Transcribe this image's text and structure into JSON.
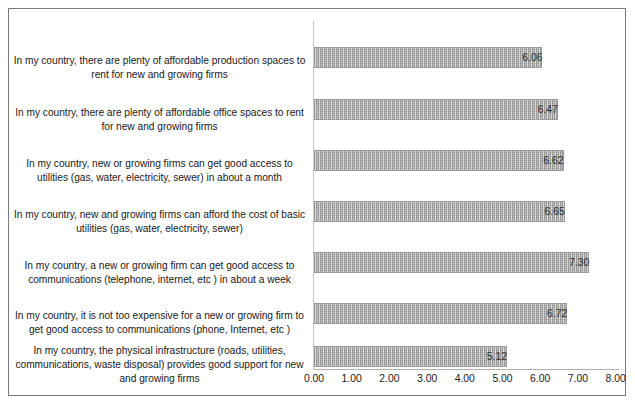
{
  "chart_data": {
    "type": "bar",
    "orientation": "horizontal",
    "title": "",
    "xlabel": "",
    "ylabel": "",
    "xlim": [
      0.0,
      8.0
    ],
    "xticks": [
      "0.00",
      "1.00",
      "2.00",
      "3.00",
      "4.00",
      "5.00",
      "6.00",
      "7.00",
      "8.00"
    ],
    "grid": false,
    "legend": "none",
    "categories": [
      "In my country, there are plenty of affordable production spaces to rent for new and growing firms",
      "In my country, there are plenty of affordable office spaces to rent for new and growing firms",
      "In my country, new or growing firms can get good access to utilities (gas, water, electricity, sewer) in about a month",
      "In my country, new and growing firms can afford the cost of basic utilities (gas, water, electricity, sewer)",
      "In my country, a new or growing firm can get good access to communications (telephone, internet, etc ) in about a week",
      "In my country, it is not too expensive for a new or growing firm to get good access to communications (phone, Internet, etc )",
      "In my country, the physical infrastructure (roads, utilities, communications, waste disposal) provides good support for new and growing firms"
    ],
    "values": [
      6.06,
      6.47,
      6.62,
      6.65,
      7.3,
      6.72,
      5.12
    ],
    "value_labels": [
      "6.06",
      "6.47",
      "6.62",
      "6.65",
      "7.30",
      "6.72",
      "5.12"
    ],
    "colors": {
      "bar_fill": "#a6a6a6",
      "bar_border": "#9a9a9a",
      "axis_line": "#c9c9c9",
      "frame_border": "#7a7a7a",
      "text": "#1a1a1a",
      "background": "#ffffff"
    }
  }
}
